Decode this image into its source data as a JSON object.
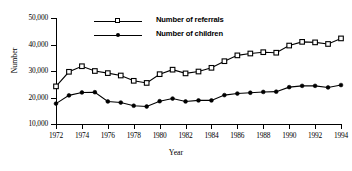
{
  "chart_data": {
    "type": "line",
    "title": "",
    "xlabel": "Year",
    "ylabel": "Number",
    "xlim": [
      1972,
      1994
    ],
    "ylim": [
      10000,
      50000
    ],
    "ytick_values": [
      10000,
      20000,
      30000,
      40000,
      50000
    ],
    "ytick_labels": [
      "10,000",
      "20,000",
      "30,000",
      "40,000",
      "50,000"
    ],
    "xtick_values": [
      1972,
      1974,
      1976,
      1978,
      1980,
      1982,
      1984,
      1986,
      1988,
      1990,
      1992,
      1994
    ],
    "xtick_labels": [
      "1972",
      "1974",
      "1976",
      "1978",
      "1980",
      "1982",
      "1984",
      "1986",
      "1988",
      "1990",
      "1992",
      "1994"
    ],
    "grid": false,
    "legend_position": "upper-center",
    "x": [
      1972,
      1973,
      1974,
      1975,
      1976,
      1977,
      1978,
      1979,
      1980,
      1981,
      1982,
      1983,
      1984,
      1985,
      1986,
      1987,
      1988,
      1989,
      1990,
      1991,
      1992,
      1993,
      1994
    ],
    "series": [
      {
        "name": "Number of referrals",
        "marker": "open-square",
        "values": [
          24200,
          29700,
          31800,
          30000,
          29200,
          28300,
          26300,
          25500,
          28800,
          30500,
          29100,
          29800,
          31200,
          33700,
          35900,
          36600,
          37100,
          36900,
          39600,
          41000,
          40800,
          40200,
          42300
        ]
      },
      {
        "name": "Number of children",
        "marker": "filled-circle",
        "values": [
          17700,
          20800,
          21900,
          22000,
          18500,
          18100,
          16900,
          16600,
          18600,
          19600,
          18500,
          18900,
          18900,
          20900,
          21500,
          21800,
          22100,
          22200,
          23900,
          24400,
          24400,
          23800,
          24700
        ]
      }
    ]
  },
  "legend": {
    "items": [
      {
        "label": "Number of referrals",
        "marker": "open-square"
      },
      {
        "label": "Number of children",
        "marker": "filled-circle"
      }
    ]
  },
  "axes": {
    "y_title": "Number",
    "x_title": "Year"
  },
  "colors": {
    "ink": "#000000",
    "background": "#ffffff"
  }
}
